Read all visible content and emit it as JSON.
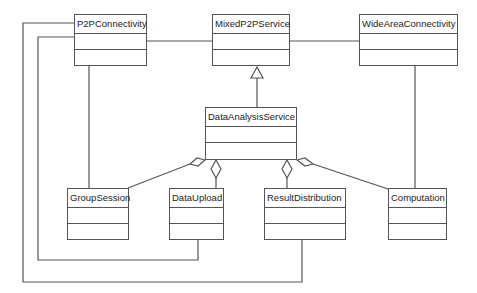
{
  "diagram": {
    "type": "UML class diagram",
    "classes": [
      {
        "id": "p2p",
        "name": "P2PConnectivity",
        "x": 74,
        "y": 14,
        "w": 73,
        "h": 52
      },
      {
        "id": "mixed",
        "name": "MixedP2PService",
        "x": 212,
        "y": 14,
        "w": 78,
        "h": 52
      },
      {
        "id": "wide",
        "name": "WideAreaConnectivity",
        "x": 359,
        "y": 14,
        "w": 99,
        "h": 52
      },
      {
        "id": "das",
        "name": "DataAnalysisService",
        "x": 205,
        "y": 107,
        "w": 92,
        "h": 53
      },
      {
        "id": "group",
        "name": "GroupSession",
        "x": 67,
        "y": 188,
        "w": 62,
        "h": 52
      },
      {
        "id": "upload",
        "name": "DataUpload",
        "x": 169,
        "y": 188,
        "w": 55,
        "h": 52
      },
      {
        "id": "result",
        "name": "ResultDistribution",
        "x": 264,
        "y": 188,
        "w": 82,
        "h": 52
      },
      {
        "id": "comp",
        "name": "Computation",
        "x": 388,
        "y": 188,
        "w": 59,
        "h": 52
      }
    ],
    "relationships": [
      {
        "type": "association",
        "from": "P2PConnectivity",
        "to": "MixedP2PService"
      },
      {
        "type": "association",
        "from": "MixedP2PService",
        "to": "WideAreaConnectivity"
      },
      {
        "type": "generalization",
        "from": "DataAnalysisService",
        "to": "MixedP2PService"
      },
      {
        "type": "aggregation",
        "whole": "DataAnalysisService",
        "part": "GroupSession"
      },
      {
        "type": "aggregation",
        "whole": "DataAnalysisService",
        "part": "DataUpload"
      },
      {
        "type": "aggregation",
        "whole": "DataAnalysisService",
        "part": "ResultDistribution"
      },
      {
        "type": "aggregation",
        "whole": "DataAnalysisService",
        "part": "Computation"
      },
      {
        "type": "association",
        "from": "P2PConnectivity",
        "to": "GroupSession"
      },
      {
        "type": "association",
        "from": "WideAreaConnectivity",
        "to": "Computation"
      },
      {
        "type": "association",
        "from": "P2PConnectivity",
        "to": "DataUpload"
      },
      {
        "type": "association",
        "from": "P2PConnectivity",
        "to": "ResultDistribution"
      }
    ]
  }
}
